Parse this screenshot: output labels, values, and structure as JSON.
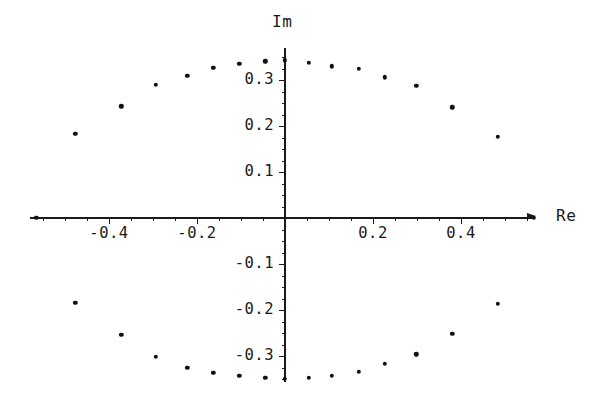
{
  "chart_data": {
    "type": "scatter",
    "title": "",
    "subtitle": "",
    "xlabel": "Re",
    "ylabel": "Im",
    "xlim": [
      -0.58,
      0.57
    ],
    "ylim": [
      -0.37,
      0.37
    ],
    "grid": false,
    "legend": null,
    "annotations": [],
    "x_ticks": [
      {
        "value": -0.4,
        "label": "-0.4"
      },
      {
        "value": -0.2,
        "label": "-0.2"
      },
      {
        "value": 0.2,
        "label": "0.2"
      },
      {
        "value": 0.4,
        "label": "0.4"
      }
    ],
    "y_ticks": [
      {
        "value": 0.3,
        "label": "0.3"
      },
      {
        "value": 0.2,
        "label": "0.2"
      },
      {
        "value": 0.1,
        "label": "0.1"
      },
      {
        "value": -0.1,
        "label": "-0.1"
      },
      {
        "value": -0.2,
        "label": "-0.2"
      },
      {
        "value": -0.3,
        "label": "-0.3"
      }
    ],
    "x_minor_tick_step": 0.05,
    "y_minor_tick_step": 0.025,
    "marker": "filled-circle",
    "marker_color": "#111111",
    "axis_color": "#1a1a1a",
    "background_color": "#ffffff",
    "points": [
      {
        "re": -0.565,
        "im": 0.0
      },
      {
        "re": -0.477,
        "im": 0.183
      },
      {
        "re": -0.372,
        "im": 0.243
      },
      {
        "re": -0.293,
        "im": 0.289
      },
      {
        "re": -0.222,
        "im": 0.309
      },
      {
        "re": -0.163,
        "im": 0.326
      },
      {
        "re": -0.104,
        "im": 0.335
      },
      {
        "re": -0.045,
        "im": 0.341
      },
      {
        "re": 0.0,
        "im": 0.343
      },
      {
        "re": 0.054,
        "im": 0.337
      },
      {
        "re": 0.107,
        "im": 0.33
      },
      {
        "re": 0.168,
        "im": 0.324
      },
      {
        "re": 0.227,
        "im": 0.306
      },
      {
        "re": 0.298,
        "im": 0.287
      },
      {
        "re": 0.38,
        "im": 0.241
      },
      {
        "re": 0.484,
        "im": 0.176
      },
      {
        "re": 0.565,
        "im": 0.0
      },
      {
        "re": 0.484,
        "im": -0.187
      },
      {
        "re": 0.38,
        "im": -0.252
      },
      {
        "re": 0.298,
        "im": -0.296
      },
      {
        "re": 0.227,
        "im": -0.317
      },
      {
        "re": 0.168,
        "im": -0.335
      },
      {
        "re": 0.107,
        "im": -0.343
      },
      {
        "re": 0.054,
        "im": -0.348
      },
      {
        "re": 0.0,
        "im": -0.35
      },
      {
        "re": -0.045,
        "im": -0.348
      },
      {
        "re": -0.104,
        "im": -0.343
      },
      {
        "re": -0.163,
        "im": -0.337
      },
      {
        "re": -0.222,
        "im": -0.326
      },
      {
        "re": -0.293,
        "im": -0.302
      },
      {
        "re": -0.372,
        "im": -0.254
      },
      {
        "re": -0.477,
        "im": -0.185
      }
    ]
  }
}
